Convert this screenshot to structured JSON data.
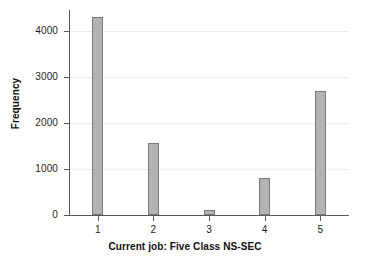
{
  "chart_data": {
    "type": "bar",
    "title": "",
    "subtitle": "",
    "xlabel": "Current job: Five Class NS-SEC",
    "ylabel": "Frequency",
    "categories": [
      "1",
      "2",
      "3",
      "4",
      "5"
    ],
    "values": [
      4300,
      1570,
      100,
      810,
      2700
    ],
    "xtick_labels": [
      "1",
      "2",
      "3",
      "4",
      "5"
    ],
    "ytick_labels": [
      "0",
      "1000",
      "2000",
      "3000",
      "4000"
    ],
    "ytick_values": [
      0,
      1000,
      2000,
      3000,
      4000
    ],
    "ylim": [
      0,
      4450
    ],
    "xlim": [
      0.5,
      5.5
    ],
    "grid": "horizontal",
    "legend": "none",
    "annotations": [],
    "bar_color": "#b3b3b3",
    "bar_edge_color": "#7a7a7c",
    "axis_color": "#59595b",
    "grid_color": "#ececed",
    "text_color": "#1d1d1d",
    "background": "#ffffff"
  }
}
